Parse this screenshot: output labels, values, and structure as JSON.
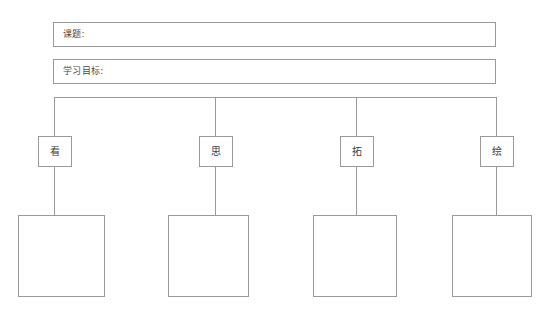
{
  "page": {
    "background_color": "#ffffff",
    "line_color": "#9a9a9a",
    "text_color": "#3c3c3c"
  },
  "header": {
    "fields": [
      {
        "label": "课题:",
        "value": "",
        "placeholder": ""
      },
      {
        "label": "学习目标:",
        "value": "",
        "placeholder": ""
      }
    ]
  },
  "diagram": {
    "nodes": [
      {
        "label": "看",
        "content": ""
      },
      {
        "label": "思",
        "content": ""
      },
      {
        "label": "拓",
        "content": ""
      },
      {
        "label": "绘",
        "content": ""
      }
    ]
  }
}
